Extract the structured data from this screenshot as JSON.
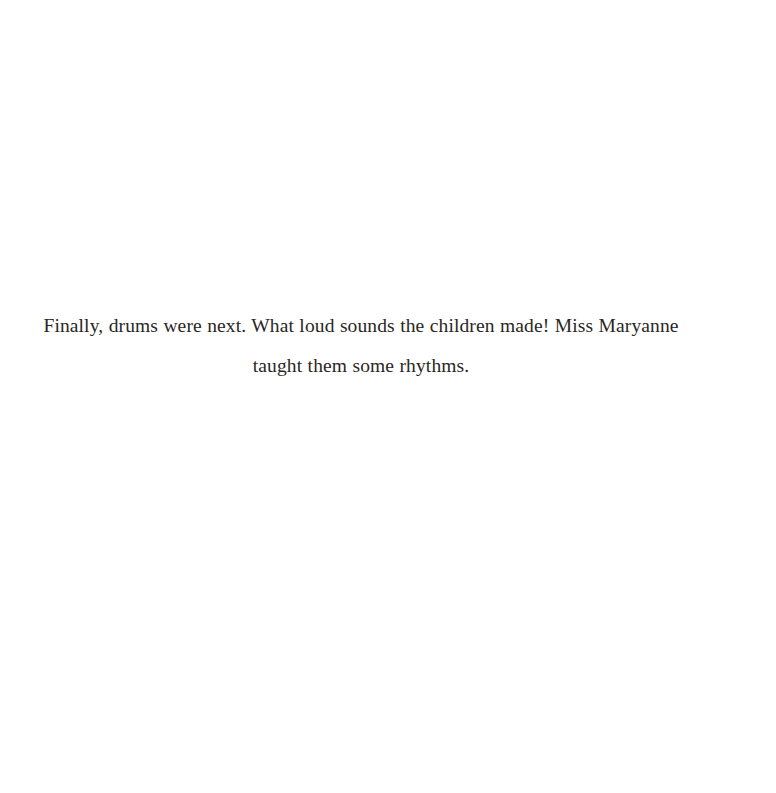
{
  "page": {
    "background_color": "#ffffff",
    "text_color": "#2a2724",
    "width": 776,
    "height": 793
  },
  "body": {
    "paragraph": "Finally, drums were next. What loud sounds the children made! Miss Maryanne taught them some rhythms.",
    "lines": [
      "Finally, drums were next. What loud sounds the children made! Miss Maryanne taught",
      "them some rhythms."
    ]
  }
}
